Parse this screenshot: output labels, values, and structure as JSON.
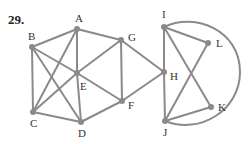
{
  "problem_number": "29.",
  "graph": {
    "nodes": [
      {
        "id": "A",
        "x": 77,
        "y": 29,
        "lx": 75,
        "ly": 22
      },
      {
        "id": "B",
        "x": 32,
        "y": 47,
        "lx": 28,
        "ly": 40
      },
      {
        "id": "C",
        "x": 33,
        "y": 112,
        "lx": 30,
        "ly": 127
      },
      {
        "id": "D",
        "x": 81,
        "y": 122,
        "lx": 78,
        "ly": 137
      },
      {
        "id": "E",
        "x": 77,
        "y": 73,
        "lx": 80,
        "ly": 90
      },
      {
        "id": "F",
        "x": 122,
        "y": 101,
        "lx": 128,
        "ly": 109
      },
      {
        "id": "G",
        "x": 121,
        "y": 40,
        "lx": 128,
        "ly": 41
      },
      {
        "id": "H",
        "x": 164,
        "y": 72,
        "lx": 170,
        "ly": 80
      },
      {
        "id": "I",
        "x": 164,
        "y": 27,
        "lx": 162,
        "ly": 18
      },
      {
        "id": "L",
        "x": 208,
        "y": 43,
        "lx": 216,
        "ly": 47
      },
      {
        "id": "K",
        "x": 211,
        "y": 107,
        "lx": 218,
        "ly": 111
      },
      {
        "id": "J",
        "x": 165,
        "y": 121,
        "lx": 163,
        "ly": 136
      }
    ],
    "edges": [
      [
        "A",
        "B"
      ],
      [
        "A",
        "G"
      ],
      [
        "A",
        "C"
      ],
      [
        "A",
        "E"
      ],
      [
        "E",
        "D"
      ],
      [
        "B",
        "C"
      ],
      [
        "B",
        "E"
      ],
      [
        "E",
        "F"
      ],
      [
        "B",
        "D"
      ],
      [
        "C",
        "E"
      ],
      [
        "E",
        "G"
      ],
      [
        "C",
        "D"
      ],
      [
        "D",
        "F"
      ],
      [
        "G",
        "F"
      ],
      [
        "G",
        "H"
      ],
      [
        "F",
        "H"
      ],
      [
        "I",
        "H"
      ],
      [
        "H",
        "J"
      ],
      [
        "I",
        "L"
      ],
      [
        "I",
        "K"
      ],
      [
        "L",
        "J"
      ],
      [
        "J",
        "K"
      ]
    ],
    "arc": {
      "from": "I",
      "to": "J",
      "path": "M164 27 C 195 12, 240 30, 240 72 C 240 110, 200 135, 165 121"
    }
  }
}
